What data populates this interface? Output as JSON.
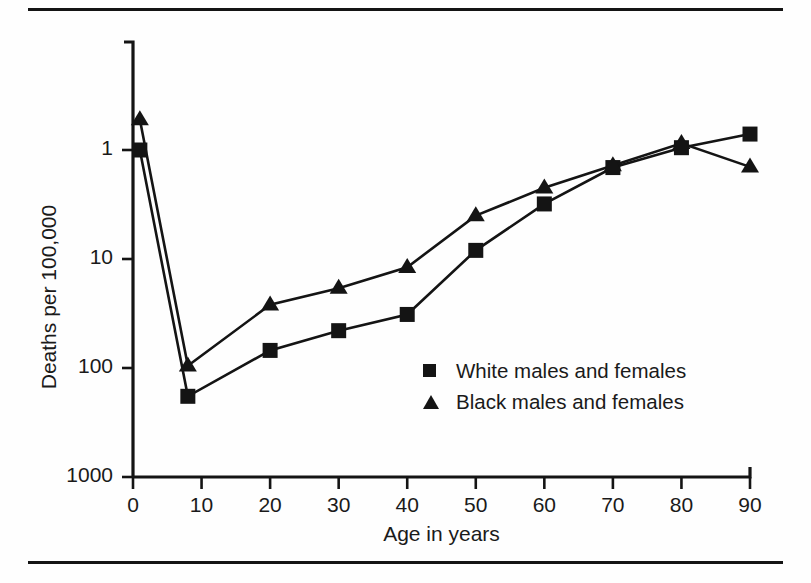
{
  "figure": {
    "has_top_rule": true,
    "has_bottom_rule": true,
    "background_color": "#fefefe",
    "ink_color": "#141414"
  },
  "axes": {
    "y_tick_labels": [
      "1000",
      "100",
      "10",
      "1"
    ],
    "x_tick_labels": [
      "0",
      "10",
      "20",
      "30",
      "40",
      "50",
      "60",
      "70",
      "80",
      "90"
    ],
    "y_title": "Deaths per 100,000",
    "x_title": "Age in years"
  },
  "legend": {
    "entries": [
      {
        "marker": "square-marker",
        "label": "White males and females"
      },
      {
        "marker": "triangle-marker",
        "label": "Black males and females"
      }
    ]
  },
  "chart_data": {
    "type": "line",
    "title": "",
    "xlabel": "Age in years",
    "ylabel": "Deaths per 100,000",
    "xlim": [
      0,
      90
    ],
    "ylim": [
      1,
      3000
    ],
    "yscale": "log",
    "xscale": "linear",
    "grid": false,
    "legend_position": "center-right-inside",
    "yticks": [
      1,
      10,
      100,
      1000
    ],
    "xticks": [
      0,
      10,
      20,
      30,
      40,
      50,
      60,
      70,
      80,
      90
    ],
    "series": [
      {
        "name": "White males and females",
        "marker": "square",
        "color": "#141414",
        "x": [
          1,
          8,
          20,
          30,
          40,
          50,
          60,
          70,
          80,
          90
        ],
        "y": [
          1000,
          5.5,
          14.5,
          22,
          31,
          120,
          320,
          690,
          1050,
          1400
        ]
      },
      {
        "name": "Black males and females",
        "marker": "triangle",
        "color": "#141414",
        "x": [
          1,
          8,
          20,
          30,
          40,
          50,
          60,
          70,
          80,
          90
        ],
        "y": [
          1900,
          10.5,
          38,
          54,
          84,
          250,
          450,
          720,
          1150,
          700
        ]
      }
    ]
  }
}
